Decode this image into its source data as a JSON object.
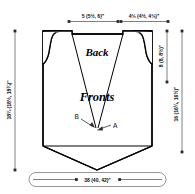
{
  "diagram": {
    "kind": "garment-schematic",
    "pieces": {
      "back_label": "Back",
      "fronts_label": "Fronts"
    },
    "callouts": [
      {
        "id": "A",
        "label": "A"
      },
      {
        "id": "B",
        "label": "B"
      }
    ],
    "dimensions": {
      "top_left": {
        "name": "shoulder-width",
        "text": "5 (5½, 6)\""
      },
      "top_right": {
        "name": "back-neck-width",
        "text": "4⅓ (4½, 4⅔)\""
      },
      "right_inner": {
        "name": "armhole-depth",
        "text": "8 (8, 8½)\""
      },
      "right_outer": {
        "name": "length-to-underarm",
        "text": "16 (16¼, 16½)\""
      },
      "left_outer": {
        "name": "total-length",
        "text": "18¼ (18½, 18¾)\""
      },
      "bottom": {
        "name": "lower-body-width",
        "text": "38 (40, 42)\""
      }
    },
    "colors": {
      "outline": "#000000",
      "dimension_line": "#4a4a4a",
      "background": "#ffffff",
      "text": "#111111"
    }
  }
}
